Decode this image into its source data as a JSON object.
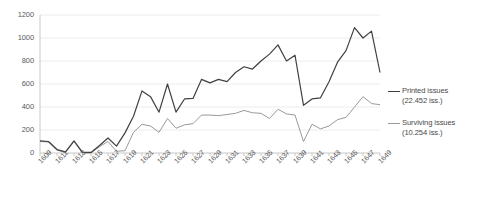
{
  "chart_data": {
    "type": "line",
    "title": "",
    "xlabel": "",
    "ylabel": "",
    "ylim": [
      0,
      1200
    ],
    "yticks": [
      0,
      200,
      400,
      600,
      800,
      1000,
      1200
    ],
    "grid": true,
    "legend_position": "right",
    "x": [
      1609,
      1610,
      1611,
      1612,
      1613,
      1614,
      1615,
      1616,
      1617,
      1618,
      1619,
      1620,
      1621,
      1622,
      1623,
      1624,
      1625,
      1626,
      1627,
      1628,
      1629,
      1630,
      1631,
      1632,
      1633,
      1634,
      1635,
      1636,
      1637,
      1638,
      1639,
      1640,
      1641,
      1642,
      1643,
      1644,
      1645,
      1646,
      1647,
      1648,
      1649
    ],
    "xtick_labels": [
      "1609",
      "1611",
      "1613",
      "1615",
      "1617",
      "1619",
      "1621",
      "1623",
      "1625",
      "1627",
      "1629",
      "1631",
      "1633",
      "1635",
      "1637",
      "1639",
      "1641",
      "1643",
      "1645",
      "1647",
      "1649"
    ],
    "series": [
      {
        "name": "Printed issues",
        "total_label": "(22.452 iss.)",
        "color": "#404040",
        "values": [
          105,
          100,
          30,
          10,
          105,
          5,
          5,
          65,
          130,
          60,
          175,
          320,
          540,
          490,
          355,
          600,
          355,
          470,
          475,
          640,
          610,
          640,
          620,
          700,
          750,
          730,
          800,
          860,
          940,
          800,
          850,
          415,
          470,
          480,
          620,
          790,
          890,
          1090,
          1000,
          1060,
          700
        ]
      },
      {
        "name": "Surviving issues",
        "total_label": "(10.254 iss.)",
        "color": "#9a9a9a",
        "values": [
          100,
          95,
          25,
          5,
          100,
          0,
          0,
          55,
          100,
          15,
          20,
          180,
          250,
          235,
          180,
          300,
          215,
          245,
          255,
          330,
          330,
          325,
          335,
          345,
          370,
          350,
          345,
          300,
          380,
          340,
          330,
          100,
          250,
          210,
          235,
          290,
          310,
          400,
          490,
          430,
          420
        ]
      }
    ]
  },
  "legend": {
    "entries": [
      {
        "label": "Printed issues",
        "sub": "(22.452 iss.)"
      },
      {
        "label": "Surviving issues",
        "sub": "(10.254 iss.)"
      }
    ]
  }
}
